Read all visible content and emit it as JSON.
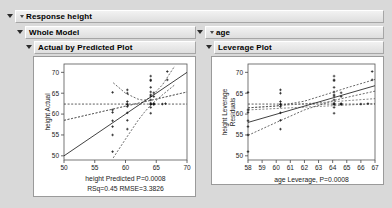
{
  "window": {
    "background_color": "#d9d9d9"
  },
  "panels": {
    "response": {
      "label": "Response height",
      "disclosure": "expanded"
    },
    "whole_model": {
      "label": "Whole Model",
      "disclosure": "expanded"
    },
    "age": {
      "label": "age",
      "disclosure": "expanded"
    },
    "actual_by_predicted": {
      "label": "Actual by Predicted Plot",
      "disclosure": "expanded"
    },
    "leverage": {
      "label": "Leverage Plot",
      "disclosure": "expanded"
    }
  },
  "chart_data": [
    {
      "type": "scatter",
      "name": "actual-by-predicted-plot",
      "title": "Actual by Predicted Plot",
      "xlabel": "height Predicted P=0.0008",
      "ylabel": "height Actual",
      "caption": "RSq=0.45 RMSE=3.3826",
      "xlim": [
        50,
        70
      ],
      "ylim": [
        49,
        72
      ],
      "xticks": [
        50,
        55,
        60,
        65,
        70
      ],
      "yticks": [
        50,
        55,
        60,
        65,
        70
      ],
      "grid": false,
      "legend": "none",
      "rsq": 0.45,
      "rmse": 3.3826,
      "p_value": 0.0008,
      "mean_line_y": 62.4,
      "fit_line": {
        "x": [
          50,
          70
        ],
        "y": [
          50,
          70
        ]
      },
      "conf_upper": {
        "x": [
          58,
          60,
          62,
          63,
          64,
          66,
          68
        ],
        "y": [
          67.5,
          65.0,
          63.6,
          63.3,
          63.9,
          67.0,
          71.5
        ]
      },
      "conf_lower": {
        "x": [
          58,
          60,
          62,
          63,
          64,
          66,
          68
        ],
        "y": [
          49.5,
          54.0,
          58.4,
          60.3,
          62.0,
          64.6,
          67.0
        ]
      },
      "mean_ci_upper": {
        "x": [
          50,
          70
        ],
        "y": [
          58.5,
          65.3
        ]
      },
      "mean_ci_lower": {
        "x": [
          50,
          70
        ],
        "y": [
          58.5,
          65.3
        ]
      },
      "points": [
        [
          57.9,
          65.2
        ],
        [
          57.9,
          61.0
        ],
        [
          57.9,
          60.4
        ],
        [
          57.9,
          58.4
        ],
        [
          57.9,
          57.0
        ],
        [
          57.9,
          55.0
        ],
        [
          57.9,
          51.0
        ],
        [
          60.3,
          65.8
        ],
        [
          60.3,
          65.0
        ],
        [
          60.3,
          63.0
        ],
        [
          60.3,
          62.4
        ],
        [
          60.3,
          62.3
        ],
        [
          60.3,
          61.8
        ],
        [
          60.3,
          60.3
        ],
        [
          60.3,
          58.5
        ],
        [
          60.3,
          56.4
        ],
        [
          64.1,
          69.1
        ],
        [
          64.1,
          68.2
        ],
        [
          64.1,
          68.0
        ],
        [
          64.1,
          66.4
        ],
        [
          64.1,
          65.3
        ],
        [
          64.1,
          64.6
        ],
        [
          64.1,
          64.3
        ],
        [
          64.1,
          63.4
        ],
        [
          64.1,
          62.6
        ],
        [
          64.1,
          62.4
        ],
        [
          64.1,
          62.3
        ],
        [
          64.1,
          61.6
        ],
        [
          64.1,
          60.2
        ],
        [
          64.6,
          65.1
        ],
        [
          64.6,
          64.2
        ],
        [
          64.6,
          62.5
        ],
        [
          64.6,
          62.4
        ],
        [
          64.6,
          62.3
        ],
        [
          66.0,
          62.4
        ],
        [
          66.5,
          62.5
        ],
        [
          66.8,
          70.2
        ],
        [
          66.8,
          68.2
        ]
      ]
    },
    {
      "type": "scatter",
      "name": "leverage-plot",
      "title": "Leverage Plot",
      "xlabel": "age Leverage, P=0.0008",
      "ylabel": "height Leverage Residuals",
      "xlim": [
        58,
        67
      ],
      "ylim": [
        49,
        72
      ],
      "xticks": [
        58,
        59,
        60,
        61,
        62,
        63,
        64,
        65,
        66,
        67
      ],
      "yticks": [
        50,
        55,
        60,
        65,
        70
      ],
      "grid": false,
      "legend": "none",
      "p_value": 0.0008,
      "mean_line_y": 62.4,
      "fit_line": {
        "x": [
          58,
          67
        ],
        "y": [
          58.0,
          66.8
        ]
      },
      "conf_upper": {
        "x": [
          58,
          60,
          62,
          64,
          65,
          67
        ],
        "y": [
          61.5,
          61.9,
          63.1,
          65.2,
          66.3,
          68.3
        ]
      },
      "conf_lower": {
        "x": [
          58,
          60,
          62,
          64,
          65,
          67
        ],
        "y": [
          54.9,
          58.0,
          61.0,
          63.2,
          64.0,
          65.5
        ]
      },
      "mean_band_upper": {
        "x": [
          58,
          67
        ],
        "y": [
          61.5,
          63.7
        ]
      },
      "mean_band_lower": {
        "x": [
          58,
          67
        ],
        "y": [
          61.0,
          62.5
        ]
      },
      "points": [
        [
          58.0,
          65.2
        ],
        [
          58.0,
          61.0
        ],
        [
          58.0,
          60.4
        ],
        [
          58.0,
          58.4
        ],
        [
          58.0,
          57.0
        ],
        [
          58.0,
          55.0
        ],
        [
          58.0,
          51.0
        ],
        [
          60.3,
          65.8
        ],
        [
          60.3,
          65.0
        ],
        [
          60.3,
          63.0
        ],
        [
          60.3,
          62.4
        ],
        [
          60.3,
          62.3
        ],
        [
          60.3,
          61.8
        ],
        [
          60.3,
          60.3
        ],
        [
          60.3,
          58.5
        ],
        [
          60.3,
          56.4
        ],
        [
          64.1,
          69.1
        ],
        [
          64.1,
          68.2
        ],
        [
          64.1,
          68.0
        ],
        [
          64.1,
          66.4
        ],
        [
          64.1,
          65.3
        ],
        [
          64.1,
          64.6
        ],
        [
          64.1,
          64.3
        ],
        [
          64.1,
          63.4
        ],
        [
          64.1,
          62.6
        ],
        [
          64.1,
          62.4
        ],
        [
          64.1,
          62.3
        ],
        [
          64.1,
          61.6
        ],
        [
          64.1,
          60.2
        ],
        [
          64.6,
          65.1
        ],
        [
          64.6,
          64.2
        ],
        [
          64.6,
          62.5
        ],
        [
          64.6,
          62.4
        ],
        [
          64.6,
          62.3
        ],
        [
          66.0,
          62.4
        ],
        [
          66.5,
          62.5
        ],
        [
          66.8,
          70.2
        ],
        [
          66.8,
          68.2
        ]
      ]
    }
  ]
}
